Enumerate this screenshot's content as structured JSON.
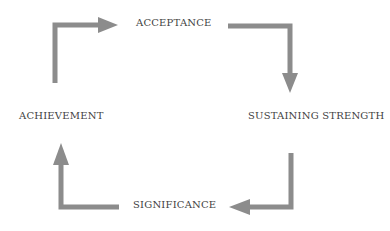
{
  "diagram": {
    "type": "cycle",
    "arrow_color": "#8c8c8c",
    "text_color": "#3f3f3f",
    "nodes": [
      {
        "id": "acceptance",
        "label": "ACCEPTANCE",
        "position": "top"
      },
      {
        "id": "sustaining-strength",
        "label": "SUSTAINING STRENGTH",
        "position": "right"
      },
      {
        "id": "significance",
        "label": "SIGNIFICANCE",
        "position": "bottom"
      },
      {
        "id": "achievement",
        "label": "ACHIEVEMENT",
        "position": "left"
      }
    ],
    "edges": [
      {
        "from": "acceptance",
        "to": "sustaining-strength",
        "direction": "clockwise"
      },
      {
        "from": "sustaining-strength",
        "to": "significance",
        "direction": "clockwise"
      },
      {
        "from": "significance",
        "to": "achievement",
        "direction": "clockwise"
      },
      {
        "from": "achievement",
        "to": "acceptance",
        "direction": "clockwise"
      }
    ]
  }
}
